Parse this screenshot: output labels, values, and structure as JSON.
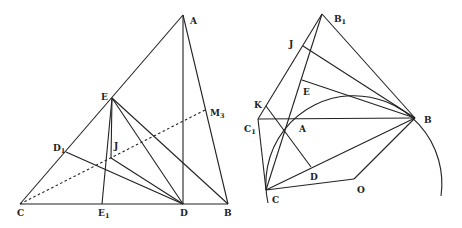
{
  "figures": [
    {
      "name": "left-figure",
      "points": {
        "A": {
          "label": "A",
          "sub": ""
        },
        "B": {
          "label": "B",
          "sub": ""
        },
        "C": {
          "label": "C",
          "sub": ""
        },
        "D": {
          "label": "D",
          "sub": ""
        },
        "E": {
          "label": "E",
          "sub": ""
        },
        "E1": {
          "label": "E",
          "sub": "1"
        },
        "D1": {
          "label": "D",
          "sub": "1"
        },
        "J": {
          "label": "J",
          "sub": ""
        },
        "M3": {
          "label": "M",
          "sub": "3"
        }
      },
      "segments": [
        "C-A",
        "A-B",
        "C-B",
        "A-D",
        "E-E1",
        "E-J",
        "E-D",
        "E-B",
        "D1-D",
        "J-D"
      ],
      "dotted_segments": [
        "C-M3"
      ]
    },
    {
      "name": "right-figure",
      "points": {
        "B1": {
          "label": "B",
          "sub": "1"
        },
        "J": {
          "label": "J",
          "sub": ""
        },
        "E": {
          "label": "E",
          "sub": ""
        },
        "K": {
          "label": "K",
          "sub": ""
        },
        "C1": {
          "label": "C",
          "sub": "1"
        },
        "A": {
          "label": "A",
          "sub": ""
        },
        "B": {
          "label": "B",
          "sub": ""
        },
        "D": {
          "label": "D",
          "sub": ""
        },
        "C": {
          "label": "C",
          "sub": ""
        },
        "O": {
          "label": "O",
          "sub": ""
        }
      },
      "segments": [
        "B1-C1",
        "B1-B",
        "B1-C",
        "J-B",
        "E-B",
        "K-D",
        "C1-B",
        "C1-C",
        "C-B",
        "C-O",
        "O-B"
      ],
      "arcs": [
        "circle centered O through A, B, C"
      ]
    }
  ]
}
